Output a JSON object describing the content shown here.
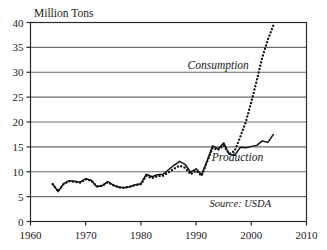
{
  "chart_data": {
    "type": "line",
    "title": "",
    "subtitle": "",
    "xlabel": "",
    "ylabel": "Million Tons",
    "xlim": [
      1960,
      2010
    ],
    "ylim": [
      0,
      40
    ],
    "xticks": [
      1960,
      1970,
      1980,
      1990,
      2000,
      2010
    ],
    "xtick_labels": [
      "1960",
      "1970",
      "1980",
      "1990",
      "2000",
      "2010"
    ],
    "yticks": [
      0,
      5,
      10,
      15,
      20,
      25,
      30,
      35,
      40
    ],
    "ytick_labels": [
      "0",
      "5",
      "10",
      "15",
      "20",
      "25",
      "30",
      "35",
      "40"
    ],
    "grid": "horizontal",
    "legend_position": "inline-annotations",
    "annotations": [
      {
        "id": "consumption-label",
        "text": "Consumption",
        "x": 1994.0,
        "y": 30.6,
        "style": "italic"
      },
      {
        "id": "production-label",
        "text": "Production",
        "x": 1997.5,
        "y": 12.2,
        "style": "italic"
      },
      {
        "id": "source-note",
        "text": "Source: USDA",
        "x": 1998.0,
        "y": 3.0,
        "style": "italic"
      }
    ],
    "series": [
      {
        "name": "Production",
        "style": "solid",
        "color": "#111111",
        "x": [
          1964,
          1965,
          1966,
          1967,
          1968,
          1969,
          1970,
          1971,
          1972,
          1973,
          1974,
          1975,
          1976,
          1977,
          1978,
          1979,
          1980,
          1981,
          1982,
          1983,
          1984,
          1985,
          1986,
          1987,
          1988,
          1989,
          1990,
          1991,
          1992,
          1993,
          1994,
          1995,
          1996,
          1997,
          1998,
          1999,
          2000,
          2001,
          2002,
          2003,
          2004
        ],
        "values": [
          7.6,
          6.0,
          7.6,
          8.2,
          8.1,
          7.9,
          8.6,
          8.3,
          7.0,
          7.2,
          8.0,
          7.3,
          6.9,
          6.8,
          7.0,
          7.4,
          7.6,
          9.5,
          9.0,
          9.4,
          9.5,
          10.4,
          11.3,
          12.1,
          11.5,
          9.9,
          10.6,
          9.4,
          12.2,
          15.2,
          14.6,
          15.8,
          13.5,
          13.3,
          14.9,
          14.8,
          15.1,
          15.3,
          16.2,
          15.9,
          17.5
        ]
      },
      {
        "name": "Consumption",
        "style": "dotted",
        "color": "#111111",
        "x": [
          1964,
          1965,
          1966,
          1967,
          1968,
          1969,
          1970,
          1971,
          1972,
          1973,
          1974,
          1975,
          1976,
          1977,
          1978,
          1979,
          1980,
          1981,
          1982,
          1983,
          1984,
          1985,
          1986,
          1987,
          1988,
          1989,
          1990,
          1991,
          1992,
          1993,
          1994,
          1995,
          1996,
          1997,
          1998,
          1999,
          2000,
          2001,
          2002,
          2003,
          2004
        ],
        "values": [
          7.5,
          6.1,
          7.5,
          8.1,
          8.0,
          7.8,
          8.5,
          8.2,
          7.1,
          7.2,
          7.9,
          7.3,
          6.9,
          6.8,
          7.0,
          7.3,
          7.5,
          9.2,
          8.7,
          9.1,
          9.2,
          9.9,
          10.6,
          11.2,
          10.8,
          9.5,
          10.2,
          9.2,
          12.0,
          14.8,
          14.4,
          15.3,
          13.6,
          14.2,
          17.0,
          20.0,
          24.0,
          28.4,
          33.0,
          36.6,
          39.4
        ]
      }
    ]
  },
  "axes": {
    "y_axis_title": "Million Tons"
  }
}
